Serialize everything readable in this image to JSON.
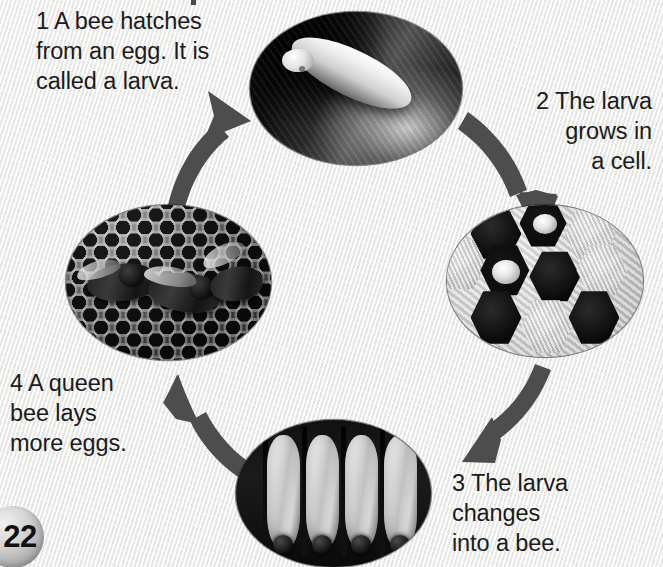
{
  "page": {
    "number": "22",
    "background_color": "#f1f1f0",
    "arrow_color": "#4d4d4d",
    "text_color": "#1b1b1b"
  },
  "diagram": {
    "type": "cycle-diagram",
    "steps": [
      {
        "number": "1",
        "text": "1 A bee hatches\nfrom an egg. It is\ncalled a larva.",
        "position": "top-left",
        "image": "larva-closeup-photo"
      },
      {
        "number": "2",
        "text": "2 The larva\ngrows in\na cell.",
        "position": "right-top",
        "image": "honeycomb-cells-photo"
      },
      {
        "number": "3",
        "text": "3 The larva\nchanges\ninto a bee.",
        "position": "bottom-right",
        "image": "pupae-in-cells-photo"
      },
      {
        "number": "4",
        "text": "4 A queen\nbee lays\nmore eggs.",
        "position": "bottom-left",
        "image": "bees-on-comb-photo"
      }
    ],
    "arrows": [
      {
        "name": "arrow-bees-to-larva",
        "from": "bees-on-comb-photo",
        "to": "larva-closeup-photo"
      },
      {
        "name": "arrow-larva-to-cells",
        "from": "larva-closeup-photo",
        "to": "honeycomb-cells-photo"
      },
      {
        "name": "arrow-cells-to-pupae",
        "from": "honeycomb-cells-photo",
        "to": "pupae-in-cells-photo"
      },
      {
        "name": "arrow-pupae-to-bees",
        "from": "pupae-in-cells-photo",
        "to": "bees-on-comb-photo"
      }
    ]
  }
}
